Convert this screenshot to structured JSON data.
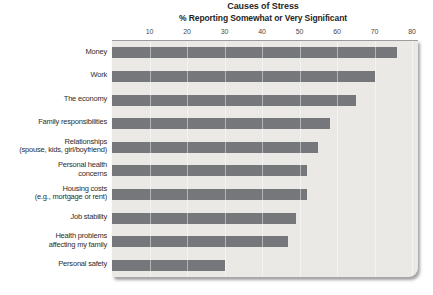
{
  "figure": {
    "title": "Causes of Stress",
    "subtitle": "% Reporting Somewhat or Very Significant"
  },
  "chart_data": {
    "type": "bar",
    "orientation": "horizontal",
    "title": "Causes of Stress",
    "subtitle": "% Reporting Somewhat or Very Significant",
    "categories": [
      "Money",
      "Work",
      "The economy",
      "Family responsibilities",
      "Relationships\n(spouse, kids, girl/boyfriend)",
      "Personal health\nconcerns",
      "Housing costs\n(e.g., mortgage or rent)",
      "Job stability",
      "Health problems\naffecting my family",
      "Personal safety"
    ],
    "values": [
      76,
      70,
      65,
      58,
      55,
      52,
      52,
      49,
      47,
      30
    ],
    "xlabel": "",
    "ylabel": "",
    "xlim": [
      0,
      80
    ],
    "xticks": [
      10,
      20,
      30,
      40,
      50,
      60,
      70,
      80
    ],
    "grid": true,
    "legend": false,
    "bar_color": "#76777a",
    "plot_bg": "#eae9e6",
    "axis_line_color": "#9d9d9d"
  }
}
